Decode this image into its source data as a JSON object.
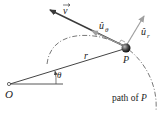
{
  "labels": {
    "origin": "O",
    "particle": "P",
    "radius": "r",
    "angle": "θ",
    "velocity": "v",
    "unit_theta": "û",
    "unit_theta_sub": "θ",
    "unit_r": "û",
    "unit_r_sub": "r",
    "path": "path of ",
    "path_italic": "P"
  },
  "colors": {
    "velocity": "#3a3a3a",
    "unit_vectors": "#a0a0a0",
    "radius": "#444444",
    "path": "#555555",
    "particle": "#2a2a2a"
  }
}
